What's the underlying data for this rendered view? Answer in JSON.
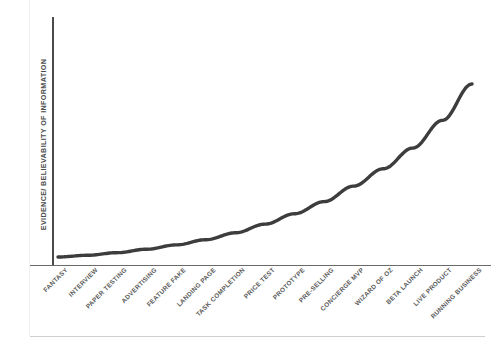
{
  "chart_data": {
    "type": "line",
    "title": "",
    "subtitle": "",
    "xlabel": "",
    "ylabel": "EVIDENCE/ BELIEVABILITY OF INFORMATION",
    "categories": [
      "FANTASY",
      "INTERVIEW",
      "PAPER TESTING",
      "ADVERTISING",
      "FEATURE FAKE",
      "LANDING PAGE",
      "TASK COMPLETION",
      "PRICE TEST",
      "PROTOTYPE",
      "PRE-SELLING",
      "CONCIERGE MVP",
      "WIZARD OF OZ",
      "BETA LAUNCH",
      "LIVE PRODUCT",
      "RUNNING BUSINESS"
    ],
    "series": [
      {
        "name": "evidence-curve",
        "values": [
          0,
          1,
          2.5,
          4.5,
          7,
          10,
          14,
          19,
          25,
          32,
          41,
          51,
          63,
          79,
          100
        ]
      }
    ],
    "xlim": [
      0,
      14
    ],
    "ylim": [
      0,
      100
    ],
    "grid": false,
    "legend": false,
    "legend_position": "none",
    "colors": {
      "curve": "#3d3d3d",
      "axis": "#4a4a4a",
      "axis_x": "#6a6a6a",
      "label": "#5a5a5a",
      "background": "#ffffff",
      "page_rule": "#cfcfcf"
    },
    "annotations": []
  }
}
